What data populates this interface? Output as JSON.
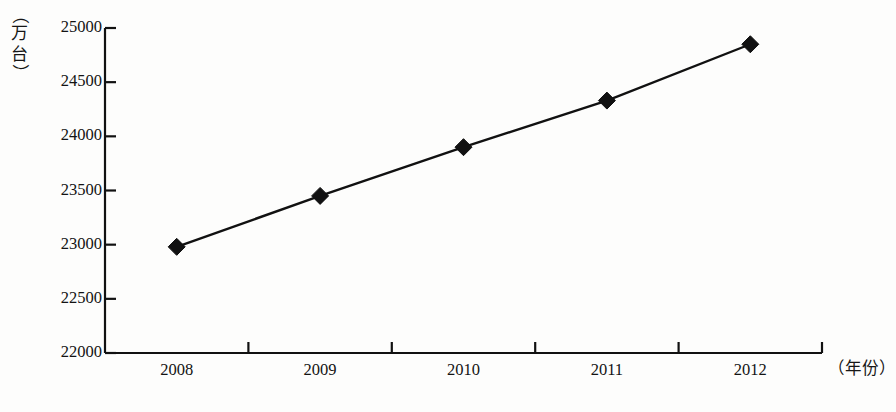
{
  "chart_data": {
    "type": "line",
    "title": "",
    "subtitle": "",
    "xlabel": "（年份）",
    "ylabel": "（万台）",
    "categories": [
      "2008",
      "2009",
      "2010",
      "2011",
      "2012"
    ],
    "values": [
      22980,
      23450,
      23900,
      24330,
      24850
    ],
    "series": [
      {
        "name": "",
        "values": [
          22980,
          23450,
          23900,
          24330,
          24850
        ]
      }
    ],
    "ylim": [
      22000,
      25000
    ],
    "y_ticks": [
      25000,
      24500,
      24000,
      23500,
      23000,
      22500,
      22000
    ],
    "y_tick_labels": [
      "25000",
      "24500",
      "24000",
      "23500",
      "23000",
      "22500",
      "22000"
    ],
    "x_tick_labels": [
      "2008",
      "2009",
      "2010",
      "2011",
      "2012"
    ],
    "grid": false,
    "legend": "none",
    "marker": "filled-diamond",
    "line_color": "#111111",
    "marker_color": "#111111",
    "background_color": "#fdfdfc"
  },
  "axis": {
    "y_caption_parts": {
      "open_paren": "（",
      "char1": "万",
      "char2": "台",
      "close_paren": "）"
    },
    "x_caption": "（年份）"
  }
}
